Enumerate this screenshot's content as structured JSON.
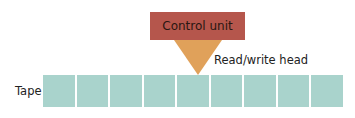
{
  "control_unit": {
    "label": "Control unit",
    "color": "#b5564c"
  },
  "head": {
    "label": "Read/write head",
    "color": "#e0a15a"
  },
  "tape": {
    "label": "Tape",
    "cell_count": 9,
    "cell_color": "#a9d3cc",
    "cells": [
      "",
      "",
      "",
      "",
      "",
      "",
      "",
      "",
      ""
    ]
  }
}
